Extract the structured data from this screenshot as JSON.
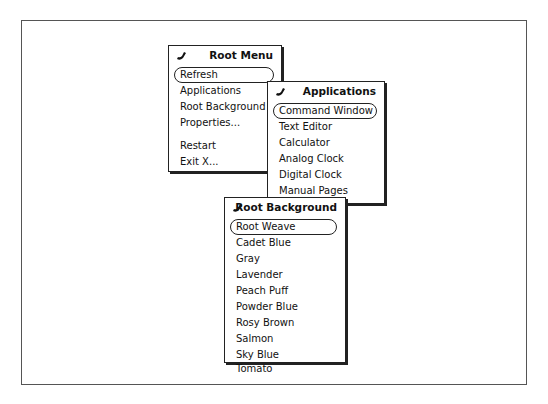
{
  "root_menu": {
    "title": "Root Menu",
    "pin_icon": "pushpin-icon",
    "items": [
      {
        "label": "Refresh",
        "default": true
      },
      {
        "label": "Applications",
        "submenu": true
      },
      {
        "label": "Root Background",
        "submenu": true
      },
      {
        "label": "Properties..."
      },
      {
        "label": "Restart"
      },
      {
        "label": "Exit X..."
      }
    ],
    "submenu_arrow": "⌐"
  },
  "applications_menu": {
    "title": "Applications",
    "pin_icon": "pushpin-icon",
    "items": [
      {
        "label": "Command Window",
        "default": true
      },
      {
        "label": "Text Editor"
      },
      {
        "label": "Calculator"
      },
      {
        "label": "Analog Clock"
      },
      {
        "label": "Digital Clock"
      },
      {
        "label": "Manual Pages"
      },
      {
        "label": "Screen Lock"
      }
    ]
  },
  "root_background_menu": {
    "title": "Root Background",
    "pin_icon": "pushpin-icon",
    "items": [
      {
        "label": "Root Weave",
        "default": true
      },
      {
        "label": "Cadet Blue"
      },
      {
        "label": "Gray"
      },
      {
        "label": "Lavender"
      },
      {
        "label": "Peach Puff"
      },
      {
        "label": "Powder Blue"
      },
      {
        "label": "Rosy Brown"
      },
      {
        "label": "Salmon"
      },
      {
        "label": "Sky Blue"
      },
      {
        "label": "Tomato"
      }
    ]
  }
}
